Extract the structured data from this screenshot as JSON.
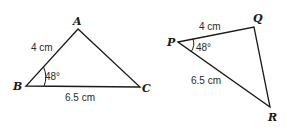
{
  "diagram": {
    "triangles": [
      {
        "name": "ABC",
        "vertices": {
          "A": {
            "label": "A",
            "x": 78,
            "y": 29
          },
          "B": {
            "label": "B",
            "x": 26,
            "y": 86
          },
          "C": {
            "label": "C",
            "x": 140,
            "y": 87
          }
        },
        "sides": {
          "AB": {
            "label": "4 cm"
          },
          "BC": {
            "label": "6.5 cm"
          }
        },
        "angle": {
          "vertex": "B",
          "label": "48°"
        }
      },
      {
        "name": "PQR",
        "vertices": {
          "P": {
            "label": "P",
            "x": 178,
            "y": 42
          },
          "Q": {
            "label": "Q",
            "x": 254,
            "y": 27
          },
          "R": {
            "label": "R",
            "x": 270,
            "y": 107
          }
        },
        "sides": {
          "PQ": {
            "label": "4 cm"
          },
          "PR": {
            "label": "6.5 cm"
          }
        },
        "angle": {
          "vertex": "P",
          "label": "48°"
        }
      }
    ]
  }
}
